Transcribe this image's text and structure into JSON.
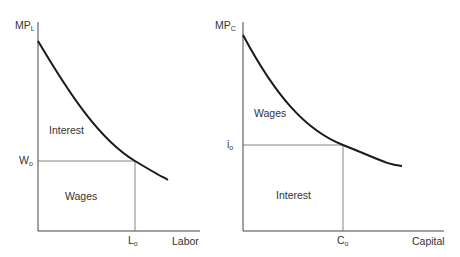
{
  "left_panel": {
    "y_axis_label": "MP",
    "y_axis_sub": "L",
    "x_axis_label": "Labor",
    "y_marker": "W",
    "y_marker_sub": "o",
    "x_marker": "L",
    "x_marker_sub": "o",
    "area_above": "Interest",
    "area_below": "Wages"
  },
  "right_panel": {
    "y_axis_label": "MP",
    "y_axis_sub": "C",
    "x_axis_label": "Capital",
    "y_marker": "i",
    "y_marker_sub": "o",
    "x_marker": "C",
    "x_marker_sub": "o",
    "area_above": "Wages",
    "area_below": "Interest"
  },
  "colors": {
    "curve": "#1a1a1a",
    "axis": "#444444",
    "guide": "#666666"
  }
}
